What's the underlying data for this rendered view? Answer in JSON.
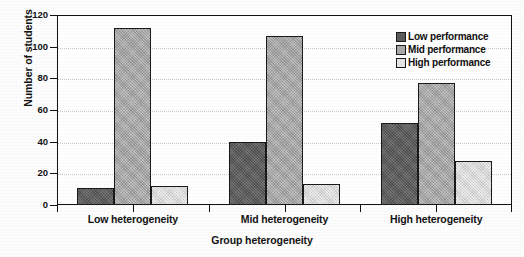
{
  "chart_data": {
    "type": "bar",
    "title": "",
    "subtitle": "",
    "xlabel": "Group heterogeneity",
    "ylabel": "Number of students",
    "categories": [
      "Low heterogeneity",
      "Mid heterogeneity",
      "High heterogeneity"
    ],
    "series": [
      {
        "name": "Low performance",
        "color": "#5c5c5c",
        "values": [
          11,
          40,
          52
        ]
      },
      {
        "name": "Mid performance",
        "color": "#aaaaaa",
        "values": [
          112,
          107,
          77
        ]
      },
      {
        "name": "High performance",
        "color": "#e2e2e2",
        "values": [
          12,
          13,
          28
        ]
      }
    ],
    "ylim": [
      0,
      120
    ],
    "yticks": [
      0,
      20,
      40,
      60,
      80,
      100,
      120
    ],
    "ytick_labels": [
      "0",
      "20",
      "40",
      "60",
      "80",
      "100",
      "120"
    ],
    "grid": true,
    "grid_axis": "y",
    "grid_style": "dotted",
    "legend_position": "top-right-inside",
    "legend_entries": [
      "Low performance",
      "Mid performance",
      "High performance"
    ],
    "plot_border": true,
    "plot_border_color": "#111111",
    "background_color": "#ffffff"
  }
}
